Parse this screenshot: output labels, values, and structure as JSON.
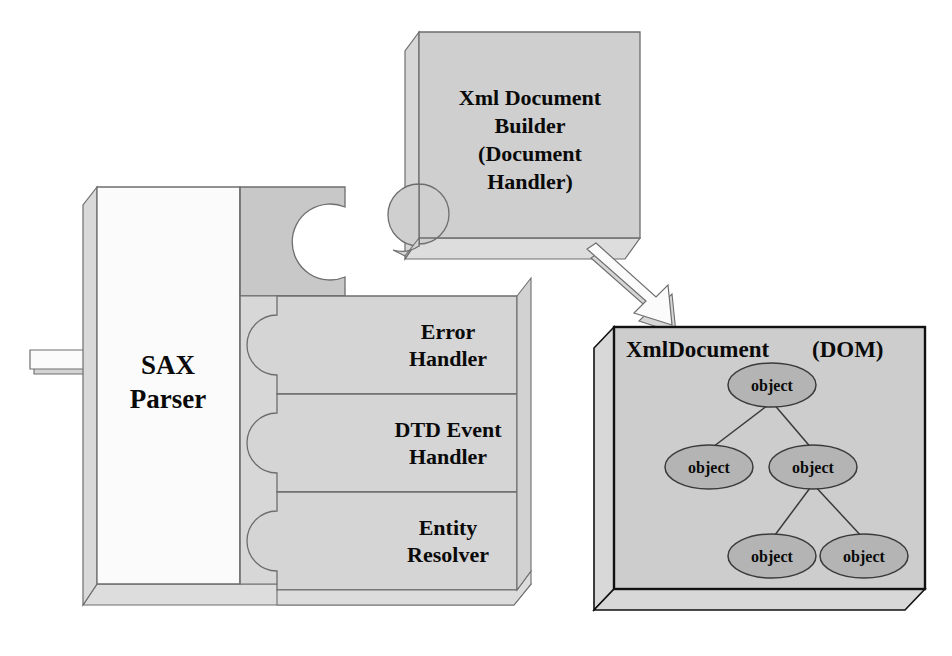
{
  "diagram": {
    "colors": {
      "face_white": "#fbfbfb",
      "face_light_gray": "#dcdcdc",
      "face_gray": "#c9c9c9",
      "face_mid_gray": "#cfcfcf",
      "side_gray": "#d5d5d5",
      "stroke_thin": "#6e6e6e",
      "stroke_thick": "#111111",
      "text": "#0a0a0a",
      "arrow_fill": "#ececec"
    },
    "sax_parser": {
      "label_line1": "SAX",
      "label_line2": "Parser"
    },
    "handlers": [
      {
        "id": "error-handler",
        "line1": "Error",
        "line2": "Handler"
      },
      {
        "id": "dtd-event-handler",
        "line1": "DTD Event",
        "line2": "Handler"
      },
      {
        "id": "entity-resolver",
        "line1": "Entity",
        "line2": "Resolver"
      }
    ],
    "builder": {
      "line1": "Xml  Document",
      "line2": "Builder",
      "line3": "(Document",
      "line4": "Handler)"
    },
    "dom_box": {
      "title": "XmlDocument",
      "subtitle": "(DOM)",
      "nodes": [
        {
          "id": "root",
          "label": "object",
          "cx": 772,
          "cy": 385
        },
        {
          "id": "child1",
          "label": "object",
          "cx": 709,
          "cy": 467
        },
        {
          "id": "child2",
          "label": "object",
          "cx": 813,
          "cy": 467
        },
        {
          "id": "leaf1",
          "label": "object",
          "cx": 772,
          "cy": 556
        },
        {
          "id": "leaf2",
          "label": "object",
          "cx": 864,
          "cy": 556
        }
      ],
      "edges": [
        {
          "from": "root",
          "to": "child1"
        },
        {
          "from": "root",
          "to": "child2"
        },
        {
          "from": "child2",
          "to": "leaf1"
        },
        {
          "from": "child2",
          "to": "leaf2"
        }
      ]
    },
    "arrows": [
      {
        "id": "input-arrow",
        "direction": "right",
        "description": "XML input into SAX Parser"
      },
      {
        "id": "builder-to-dom-arrow",
        "direction": "down-right",
        "description": "Xml Document Builder produces XmlDocument"
      }
    ]
  }
}
